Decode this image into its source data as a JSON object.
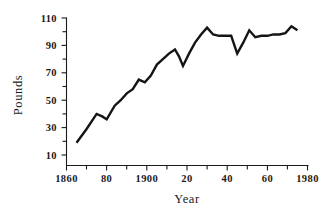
{
  "chart_data": {
    "type": "line",
    "title": "",
    "subtitle": "",
    "xlabel": "Year",
    "ylabel": "Pounds",
    "xlim": [
      1860,
      1980
    ],
    "ylim": [
      10,
      110
    ],
    "grid": false,
    "legend": null,
    "x_tick_labels": [
      "1860",
      "80",
      "1900",
      "20",
      "40",
      "60",
      "1980"
    ],
    "x_tick_values": [
      1860,
      1880,
      1900,
      1920,
      1940,
      1960,
      1980
    ],
    "x_minor_ticks": [
      1870,
      1890,
      1910,
      1930,
      1950,
      1970
    ],
    "y_tick_labels": [
      "110",
      "90",
      "70",
      "50",
      "30",
      "10"
    ],
    "y_tick_values": [
      110,
      90,
      70,
      50,
      30,
      10
    ],
    "y_minor_ticks": [
      100,
      80,
      60,
      40,
      20
    ],
    "series": [
      {
        "name": "Pounds",
        "color": "#151515",
        "x": [
          1865,
          1870,
          1875,
          1878,
          1880,
          1884,
          1887,
          1890,
          1893,
          1896,
          1899,
          1902,
          1905,
          1908,
          1911,
          1914,
          1916,
          1918,
          1921,
          1924,
          1927,
          1930,
          1933,
          1936,
          1939,
          1942,
          1945,
          1948,
          1951,
          1954,
          1957,
          1960,
          1963,
          1966,
          1969,
          1972,
          1975
        ],
        "values": [
          19,
          29,
          40,
          38,
          36,
          46,
          50,
          55,
          58,
          65,
          63,
          68,
          76,
          80,
          84,
          87,
          82,
          75,
          84,
          92,
          98,
          103,
          98,
          97,
          97,
          97,
          84,
          92,
          101,
          96,
          97,
          97,
          98,
          98,
          99,
          104,
          101
        ]
      }
    ]
  },
  "axis": {
    "x_axis_name": "x-axis",
    "y_axis_name": "y-axis"
  }
}
